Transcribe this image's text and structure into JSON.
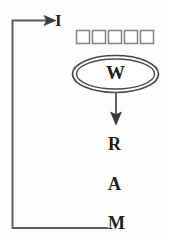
{
  "diagram": {
    "stroke_color": "#4a4a4a",
    "text_color": "#231f20",
    "background_color": "#fefefe",
    "nodes": [
      {
        "id": "i",
        "label": "I"
      },
      {
        "id": "w",
        "label": "W"
      },
      {
        "id": "r",
        "label": "R"
      },
      {
        "id": "a",
        "label": "A"
      },
      {
        "id": "m",
        "label": "M"
      }
    ],
    "squares": {
      "name": "square-row",
      "count": 5,
      "labels": [
        "",
        "",
        "",
        "",
        ""
      ]
    },
    "connectors": [
      {
        "from": "m",
        "to": "i",
        "style": "feedback-loop",
        "arrowhead": true
      },
      {
        "from": "w",
        "to": "r",
        "style": "straight-down",
        "arrowhead": true
      }
    ]
  }
}
